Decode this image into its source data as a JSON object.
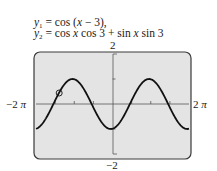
{
  "equations": {
    "line1": {
      "lhs": "y",
      "sub": "1",
      "rhs": " = cos (x − 3),",
      "rhs_parts": [
        "cos (",
        "x",
        " − 3),"
      ]
    },
    "line2": {
      "lhs": "y",
      "sub": "2",
      "rhs_parts": [
        "cos ",
        "x",
        " cos 3 + sin ",
        "x",
        " sin 3"
      ]
    }
  },
  "axes": {
    "y_max_label": "2",
    "y_min_label": "−2",
    "x_min_label": "−2",
    "x_min_pi": "π",
    "x_max_label": "2",
    "x_max_pi": "π"
  },
  "colors": {
    "screen_bg": "#e4e4e4",
    "frame": "#3a3a3a",
    "curve": "#111111",
    "axis": "#555555"
  },
  "chart_data": {
    "type": "line",
    "xlabel": "",
    "ylabel": "",
    "xlim": [
      -6.2832,
      6.2832
    ],
    "ylim": [
      -2,
      2
    ],
    "x_tick_labels": [
      "−2π",
      "2π"
    ],
    "y_tick_labels": [
      "2",
      "−2"
    ],
    "x_tick_step": 1.5708,
    "y_tick_step": 1,
    "grid": false,
    "series": [
      {
        "name": "y1 = cos(x − 3) (identical to y2)",
        "x": [
          -6.28,
          -5.5,
          -4.71,
          -3.93,
          -3.28,
          -3.14,
          -2.36,
          -1.57,
          -0.79,
          -0.14,
          0,
          0.79,
          1.57,
          2.36,
          3.0,
          3.14,
          3.93,
          4.71,
          5.5,
          6.28
        ],
        "values": [
          -0.96,
          -0.3,
          0.44,
          0.97,
          1.0,
          0.99,
          0.75,
          0.04,
          -0.69,
          -1.0,
          -0.99,
          -0.61,
          0.04,
          0.79,
          1.0,
          0.99,
          0.6,
          -0.14,
          -0.77,
          -0.96
        ]
      }
    ],
    "annotations": [
      {
        "type": "trace-cursor-circle",
        "x": -4.38,
        "y": 0.44
      }
    ]
  }
}
